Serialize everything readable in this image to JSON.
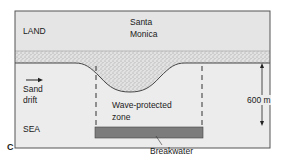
{
  "diagram": {
    "panel_label": "C",
    "regions": {
      "land": "LAND",
      "sea": "SEA"
    },
    "place_name_line1": "Santa",
    "place_name_line2": "Monica",
    "sand_drift_line1": "Sand",
    "sand_drift_line2": "drift",
    "zone_line1": "Wave-protected",
    "zone_line2": "zone",
    "breakwater": "Breakwater",
    "distance": "600 m",
    "colors": {
      "land_fill": "#e6e6e6",
      "sea_fill": "#ececec",
      "sand_fill": "#dcdcdc",
      "breakwater_fill": "#7a7a7a",
      "frame": "#555555"
    }
  }
}
